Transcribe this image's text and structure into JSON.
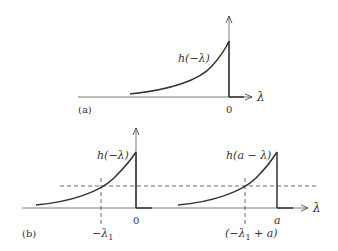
{
  "panel_a": {
    "tag": "(a)",
    "function_label": "h(−λ)",
    "axis_label": "λ",
    "origin_label": "0"
  },
  "panel_b": {
    "tag": "(b)",
    "function_label_1": "h(−λ)",
    "function_label_2": "h(a − λ)",
    "axis_label": "λ",
    "origin_label": "0",
    "shift_label": "a",
    "lambda1_label": "−λ",
    "lambda1_sub": "1",
    "shifted_label_prefix": "(−λ",
    "shifted_label_sub": "1",
    "shifted_label_suffix": " + a)"
  },
  "colors": {
    "stroke": "#333333",
    "dashed": "#444444"
  }
}
